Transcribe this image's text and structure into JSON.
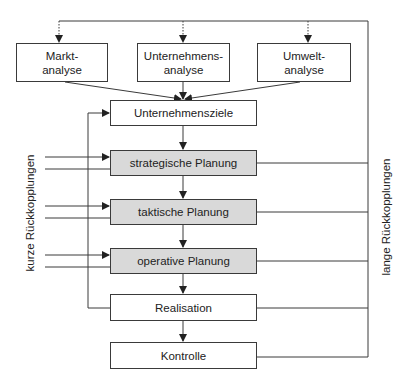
{
  "analysis_boxes": [
    {
      "line1": "Markt-",
      "line2": "analyse"
    },
    {
      "line1": "Unternehmens-",
      "line2": "analyse"
    },
    {
      "line1": "Umwelt-",
      "line2": "analyse"
    }
  ],
  "process_boxes": [
    {
      "label": "Unternehmensziele",
      "shaded": false
    },
    {
      "label": "strategische Planung",
      "shaded": true
    },
    {
      "label": "taktische Planung",
      "shaded": true
    },
    {
      "label": "operative Planung",
      "shaded": true
    },
    {
      "label": "Realisation",
      "shaded": false
    },
    {
      "label": "Kontrolle",
      "shaded": false
    }
  ],
  "side_labels": {
    "left": "kurze Rückkopplungen",
    "right": "lange Rückkopplungen"
  },
  "colors": {
    "line": "#3a3a3a",
    "shaded_fill": "#d9d9d9"
  }
}
